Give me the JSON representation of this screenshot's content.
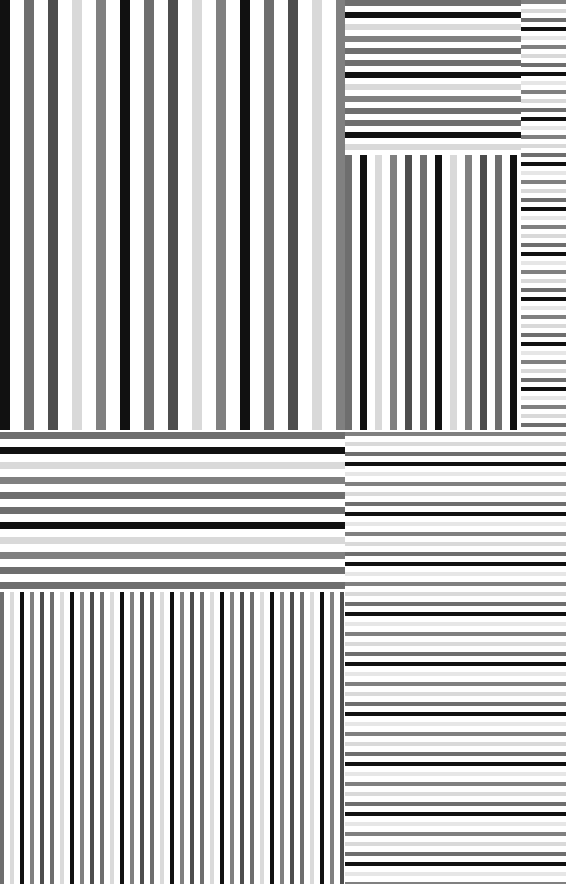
{
  "image": {
    "title": "Grayscale Stripe Pattern Composite",
    "width": 566,
    "height": 884,
    "background": "#ffffff",
    "description": "Six rectangular panels tiled over a white page, each filled with parallel grayscale bars of differing width, spacing and orientation."
  },
  "palette": {
    "white": "#ffffff",
    "near_white": "#fafafa",
    "light_gray": "#d9d9d9",
    "pale_gray": "#e6e6e6",
    "mid_gray": "#808080",
    "gray": "#6e6e6e",
    "dark_gray": "#4d4d4d",
    "black": "#111111",
    "pure_black": "#000000"
  },
  "panels": [
    {
      "name": "top-left-wide-vertical-bars",
      "orientation": "vertical",
      "x": 0,
      "y": 0,
      "width": 345,
      "height": 430,
      "period": 24,
      "bar_count": 29,
      "cycle_colors": [
        "#111111",
        "#6e6e6e",
        "#4d4d4d",
        "#d9d9d9",
        "#808080"
      ],
      "bar_width": 10,
      "gap": 14
    },
    {
      "name": "top-right-horizontal-bands",
      "orientation": "horizontal",
      "x": 345,
      "y": 0,
      "width": 176,
      "height": 153,
      "period": 12,
      "bar_count": 13,
      "cycle_colors": [
        "#6e6e6e",
        "#111111",
        "#d9d9d9",
        "#808080",
        "#6e6e6e"
      ],
      "bar_width": 6,
      "gap": 6
    },
    {
      "name": "middle-right-vertical-bars",
      "orientation": "vertical",
      "x": 345,
      "y": 155,
      "width": 176,
      "height": 275,
      "period": 15,
      "bar_count": 12,
      "cycle_colors": [
        "#6e6e6e",
        "#111111",
        "#d9d9d9",
        "#808080",
        "#4d4d4d"
      ],
      "bar_width": 7,
      "gap": 8
    },
    {
      "name": "right-column-fine-horizontal-lines",
      "orientation": "horizontal",
      "x": 521,
      "y": 0,
      "width": 45,
      "height": 430,
      "period": 9,
      "bar_count": 48,
      "cycle_colors": [
        "#808080",
        "#d9d9d9",
        "#6e6e6e",
        "#111111",
        "#e6e6e6"
      ],
      "bar_width": 4,
      "gap": 5
    },
    {
      "name": "middle-left-horizontal-bands",
      "orientation": "horizontal",
      "x": 0,
      "y": 432,
      "width": 345,
      "height": 158,
      "period": 15,
      "bar_count": 11,
      "cycle_colors": [
        "#6e6e6e",
        "#111111",
        "#d9d9d9",
        "#808080",
        "#6e6e6e"
      ],
      "bar_width": 7,
      "gap": 8
    },
    {
      "name": "bottom-left-dense-vertical-bars",
      "orientation": "vertical",
      "x": 0,
      "y": 592,
      "width": 345,
      "height": 292,
      "period": 10,
      "bar_count": 69,
      "cycle_colors": [
        "#6e6e6e",
        "#d9d9d9",
        "#111111",
        "#808080",
        "#4d4d4d"
      ],
      "bar_width": 4,
      "gap": 6
    },
    {
      "name": "bottom-right-fine-horizontal-lines",
      "orientation": "horizontal",
      "x": 345,
      "y": 432,
      "width": 221,
      "height": 452,
      "period": 10,
      "bar_count": 46,
      "cycle_colors": [
        "#808080",
        "#d9d9d9",
        "#6e6e6e",
        "#111111",
        "#e6e6e6"
      ],
      "bar_width": 4,
      "gap": 6
    }
  ],
  "chart_data": {
    "type": "heatmap",
    "subtitle": "",
    "xlabel": "",
    "ylabel": "",
    "legend": [],
    "grid": false,
    "note": "Six stripe panels; values below are the repeating grayscale luminance cycle (0=black,255=white) per panel.",
    "categories": [
      "top-left-wide-vertical-bars",
      "top-right-horizontal-bands",
      "middle-right-vertical-bars",
      "right-column-fine-horizontal-lines",
      "middle-left-horizontal-bands",
      "bottom-left-dense-vertical-bars",
      "bottom-right-fine-horizontal-lines"
    ],
    "series": [
      {
        "name": "stripe-period-px",
        "values": [
          24,
          12,
          15,
          9,
          15,
          10,
          10
        ]
      },
      {
        "name": "bar-count",
        "values": [
          29,
          13,
          12,
          48,
          11,
          69,
          46
        ]
      },
      {
        "name": "bar-width-px",
        "values": [
          10,
          6,
          7,
          4,
          7,
          4,
          4
        ]
      }
    ],
    "luminance_cycle": [
      17,
      110,
      77,
      217,
      128
    ]
  }
}
